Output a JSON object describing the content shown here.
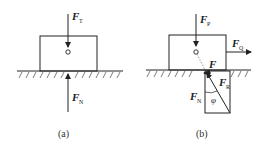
{
  "diagram": {
    "panels": [
      {
        "id": "a",
        "caption": "(a)",
        "forces": [
          {
            "symbol": "F",
            "subscript": "T",
            "direction": "down"
          },
          {
            "symbol": "F",
            "subscript": "N",
            "direction": "up"
          }
        ]
      },
      {
        "id": "b",
        "caption": "(b)",
        "forces": [
          {
            "symbol": "F",
            "subscript": "P",
            "direction": "down"
          },
          {
            "symbol": "F",
            "subscript": "Q",
            "direction": "right"
          },
          {
            "symbol": "F",
            "subscript": "",
            "direction": "friction-left"
          },
          {
            "symbol": "F",
            "subscript": "N",
            "direction": "up"
          },
          {
            "symbol": "F",
            "subscript": "R",
            "direction": "up-left"
          }
        ],
        "angle_label": "φ"
      }
    ],
    "colors": {
      "line": "#222222",
      "dashed": "#777777"
    }
  }
}
